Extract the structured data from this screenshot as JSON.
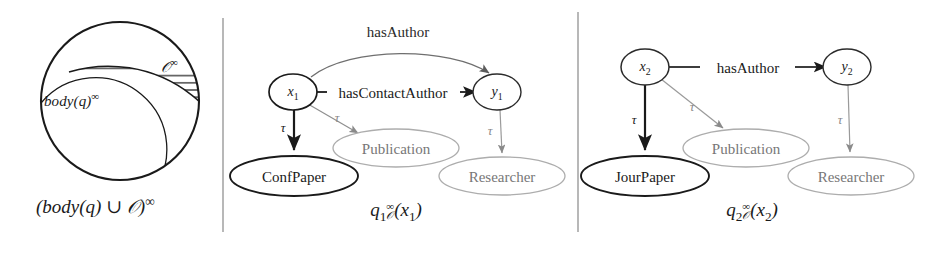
{
  "figure": {
    "panels": [
      {
        "id": "venn",
        "caption": "(body(q) ∪ 𝒪)^∞",
        "caption_parts": {
          "open": "(",
          "body": "body(q)",
          "union": " ∪ ",
          "onto": "𝒪",
          "close": ")",
          "sup": "∞"
        },
        "labels": {
          "body_base": "body(q)",
          "body_sup": "∞",
          "onto_base": "𝒪",
          "onto_sup": "∞"
        },
        "regions": [
          {
            "name": "universe-circle",
            "style": "solid-black-outline"
          },
          {
            "name": "body-region",
            "style": "thin-outline"
          },
          {
            "name": "ontology-region",
            "style": "horizontal-hatched"
          }
        ]
      },
      {
        "id": "q1",
        "caption_parts": {
          "q": "q",
          "qsub": "1",
          "sup": "∞",
          "sub": "𝒪",
          "args": "(x",
          "argsub": "1",
          "argsclose": ")"
        },
        "variables": [
          {
            "name": "x1",
            "base": "x",
            "sub": "1",
            "x": 293,
            "y": 93,
            "emphasis": "bold"
          },
          {
            "name": "y1",
            "base": "y",
            "sub": "1",
            "x": 497,
            "y": 93,
            "emphasis": "normal"
          }
        ],
        "concepts": [
          {
            "name": "ConfPaper",
            "label": "ConfPaper",
            "x": 294,
            "y": 176,
            "rx": 63,
            "ry": 20,
            "emphasis": "bold"
          },
          {
            "name": "Publication",
            "label": "Publication",
            "x": 396,
            "y": 148,
            "rx": 63,
            "ry": 19,
            "emphasis": "dim"
          },
          {
            "name": "Researcher",
            "label": "Researcher",
            "x": 502,
            "y": 176,
            "rx": 63,
            "ry": 19,
            "emphasis": "dim"
          }
        ],
        "edges": [
          {
            "name": "hasAuthor",
            "label": "hasAuthor",
            "from": "x1",
            "to": "y1",
            "shape": "arc",
            "label_x": 398,
            "label_y": 32,
            "emphasis": "dim"
          },
          {
            "name": "hasContactAuthor",
            "label": "hasContactAuthor",
            "from": "x1",
            "to": "y1",
            "shape": "straight",
            "label_x": 398,
            "label_y": 93,
            "emphasis": "bold"
          },
          {
            "name": "tau-x1-confpaper",
            "label": "τ",
            "from": "x1",
            "to": "ConfPaper",
            "label_x": 283,
            "label_y": 128,
            "emphasis": "bold"
          },
          {
            "name": "tau-x1-publication",
            "label": "τ",
            "from": "x1",
            "to": "Publication",
            "label_x": 337,
            "label_y": 118,
            "emphasis": "dim"
          },
          {
            "name": "tau-y1-researcher",
            "label": "τ",
            "from": "y1",
            "to": "Researcher",
            "label_x": 490,
            "label_y": 131,
            "emphasis": "dim"
          }
        ]
      },
      {
        "id": "q2",
        "caption_parts": {
          "q": "q",
          "qsub": "2",
          "sup": "∞",
          "sub": "𝒪",
          "args": "(x",
          "argsub": "2",
          "argsclose": ")"
        },
        "variables": [
          {
            "name": "x2",
            "base": "x",
            "sub": "2",
            "x": 645,
            "y": 68,
            "emphasis": "normal"
          },
          {
            "name": "y2",
            "base": "y",
            "sub": "2",
            "x": 847,
            "y": 68,
            "emphasis": "normal"
          }
        ],
        "concepts": [
          {
            "name": "JourPaper",
            "label": "JourPaper",
            "x": 645,
            "y": 176,
            "rx": 63,
            "ry": 20,
            "emphasis": "bold"
          },
          {
            "name": "Publication",
            "label": "Publication",
            "x": 746,
            "y": 148,
            "rx": 63,
            "ry": 19,
            "emphasis": "dim"
          },
          {
            "name": "Researcher",
            "label": "Researcher",
            "x": 851,
            "y": 176,
            "rx": 63,
            "ry": 19,
            "emphasis": "dim"
          }
        ],
        "edges": [
          {
            "name": "hasAuthor",
            "label": "hasAuthor",
            "from": "x2",
            "to": "y2",
            "shape": "straight",
            "label_x": 748,
            "label_y": 68,
            "emphasis": "bold"
          },
          {
            "name": "tau-x2-jourpaper",
            "label": "τ",
            "from": "x2",
            "to": "JourPaper",
            "label_x": 634,
            "label_y": 120,
            "emphasis": "bold"
          },
          {
            "name": "tau-x2-publication",
            "label": "τ",
            "from": "x2",
            "to": "Publication",
            "label_x": 692,
            "label_y": 107,
            "emphasis": "dim"
          },
          {
            "name": "tau-y2-researcher",
            "label": "τ",
            "from": "y2",
            "to": "Researcher",
            "label_x": 840,
            "label_y": 120,
            "emphasis": "dim"
          }
        ]
      }
    ],
    "separators": [
      {
        "name": "separator-left",
        "x": 223,
        "y1": 18,
        "y2": 232
      },
      {
        "name": "separator-right",
        "x": 578,
        "y1": 12,
        "y2": 232
      }
    ],
    "colors": {
      "ink": "#1a1a1a",
      "dim": "#8a8a8a",
      "hatch": "#4a4a4a",
      "separator": "#999999",
      "background": "#ffffff"
    }
  }
}
